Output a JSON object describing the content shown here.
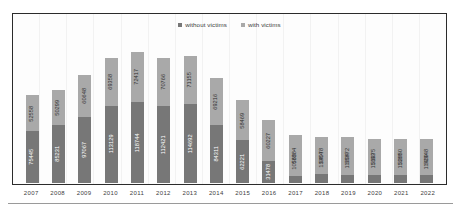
{
  "legend": {
    "items": [
      {
        "label": "without victims",
        "color": "#777777"
      },
      {
        "label": "with victims",
        "color": "#a9a9a9"
      }
    ]
  },
  "chart_data": {
    "type": "bar",
    "title": "",
    "xlabel": "",
    "ylabel": "",
    "stacked": true,
    "grid": true,
    "legend_position": "top-center",
    "ylim": [
      0,
      200000
    ],
    "categories": [
      "2007",
      "2008",
      "2009",
      "2010",
      "2011",
      "2012",
      "2013",
      "2014",
      "2015",
      "2016",
      "2017",
      "2018",
      "2019",
      "2020",
      "2021",
      "2022"
    ],
    "series": [
      {
        "name": "without victims",
        "color": "#777777",
        "values": [
          75445,
          85231,
          97067,
          113129,
          118744,
          112421,
          114692,
          84311,
          62221,
          31478,
          10563,
          13354,
          11604,
          11693,
          11689,
          11409
        ]
      },
      {
        "name": "with victims",
        "color": "#a9a9a9",
        "values": [
          52558,
          50299,
          60648,
          69358,
          72417,
          70766,
          71155,
          69216,
          58469,
          60227,
          58884,
          54078,
          55872,
          51975,
          52650,
          52948
        ]
      }
    ]
  }
}
